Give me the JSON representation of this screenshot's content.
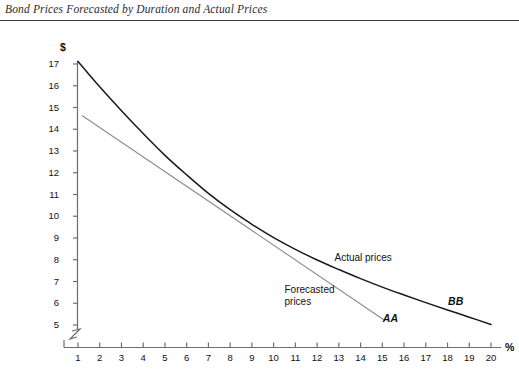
{
  "header": {
    "title": "Bond Prices Forecasted by Duration and Actual Prices"
  },
  "chart_data": {
    "type": "line",
    "title": "Bond Prices Forecasted by Duration and Actual Prices",
    "xlabel": "%",
    "ylabel": "$",
    "xlim": [
      1,
      20
    ],
    "ylim": [
      5,
      17
    ],
    "grid": false,
    "legend": "inline-annotations",
    "x_ticks": [
      "1",
      "2",
      "3",
      "4",
      "5",
      "6",
      "7",
      "8",
      "9",
      "10",
      "11",
      "12",
      "13",
      "14",
      "15",
      "16",
      "17",
      "18",
      "19",
      "20"
    ],
    "y_ticks": [
      "17",
      "16",
      "15",
      "14",
      "13",
      "12",
      "11",
      "10",
      "9",
      "8",
      "7",
      "6",
      "5"
    ],
    "axis_break_x": true,
    "axis_break_y": true,
    "annotations": [
      {
        "name": "actual-prices-label",
        "text": "Actual prices",
        "x": 12.8,
        "y": 8.1
      },
      {
        "name": "forecasted-prices-label",
        "text": "Forecasted\nprices",
        "x": 10.5,
        "y": 6.6
      },
      {
        "name": "curve-label-aa",
        "text": "AA",
        "x": 15.3,
        "y": 5.3
      },
      {
        "name": "curve-label-bb",
        "text": "BB",
        "x": 18.3,
        "y": 6.1
      }
    ],
    "series": [
      {
        "name": "BB",
        "label": "Actual prices",
        "style": "curve",
        "color": "#1a1a1a",
        "points": [
          {
            "x": 1.0,
            "y": 17.12
          },
          {
            "x": 2.0,
            "y": 15.95
          },
          {
            "x": 3.0,
            "y": 14.85
          },
          {
            "x": 4.0,
            "y": 13.8
          },
          {
            "x": 5.0,
            "y": 12.8
          },
          {
            "x": 6.0,
            "y": 11.9
          },
          {
            "x": 7.0,
            "y": 11.05
          },
          {
            "x": 8.0,
            "y": 10.3
          },
          {
            "x": 9.0,
            "y": 9.63
          },
          {
            "x": 10.0,
            "y": 9.02
          },
          {
            "x": 11.0,
            "y": 8.48
          },
          {
            "x": 12.0,
            "y": 7.99
          },
          {
            "x": 13.0,
            "y": 7.55
          },
          {
            "x": 14.0,
            "y": 7.13
          },
          {
            "x": 15.0,
            "y": 6.74
          },
          {
            "x": 16.0,
            "y": 6.38
          },
          {
            "x": 17.0,
            "y": 6.03
          },
          {
            "x": 18.0,
            "y": 5.69
          },
          {
            "x": 19.0,
            "y": 5.36
          },
          {
            "x": 20.0,
            "y": 5.02
          }
        ]
      },
      {
        "name": "AA",
        "label": "Forecasted prices",
        "style": "straight",
        "color": "#8d8d8d",
        "points": [
          {
            "x": 1.2,
            "y": 14.62
          },
          {
            "x": 15.1,
            "y": 5.22
          }
        ]
      }
    ]
  }
}
